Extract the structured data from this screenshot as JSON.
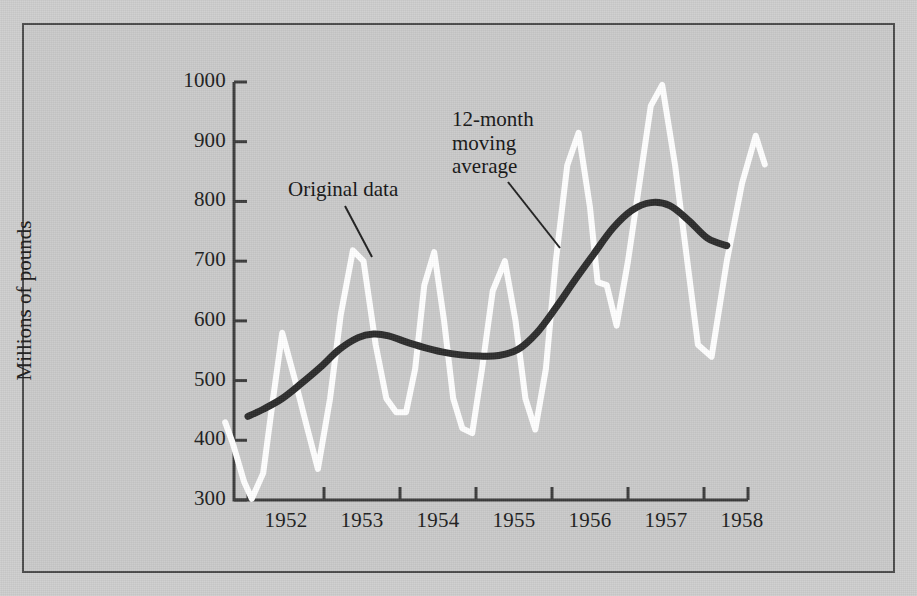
{
  "figure": {
    "background_color": "#c9c9c9",
    "border_color": "#4a4a4a"
  },
  "chart_data": {
    "type": "line",
    "title": "",
    "xlabel": "",
    "ylabel": "Millions of pounds",
    "ylim": [
      300,
      1000
    ],
    "yticks": [
      300,
      400,
      500,
      600,
      700,
      800,
      900,
      1000
    ],
    "ytick_labels": [
      "300",
      "400",
      "500",
      "600",
      "700",
      "800",
      "900",
      "1000"
    ],
    "xlim": [
      1951.67,
      1958.83
    ],
    "xticks": [
      1952,
      1953,
      1954,
      1955,
      1956,
      1957,
      1958
    ],
    "xtick_labels": [
      "1952",
      "1953",
      "1954",
      "1955",
      "1956",
      "1957",
      "1958"
    ],
    "grid": false,
    "legend": "annotations",
    "series": [
      {
        "name": "Original data",
        "color": "#ffffff",
        "line_width": 6,
        "x": [
          1951.7,
          1951.8,
          1951.95,
          1952.05,
          1952.2,
          1952.33,
          1952.45,
          1952.62,
          1952.78,
          1952.92,
          1953.08,
          1953.22,
          1953.38,
          1953.52,
          1953.68,
          1953.82,
          1953.95,
          1954.08,
          1954.2,
          1954.32,
          1954.45,
          1954.58,
          1954.7,
          1954.82,
          1954.95,
          1955.08,
          1955.22,
          1955.38,
          1955.52,
          1955.65,
          1955.78,
          1955.92,
          1956.05,
          1956.2,
          1956.35,
          1956.5,
          1956.6,
          1956.72,
          1956.85,
          1957.0,
          1957.15,
          1957.3,
          1957.45,
          1957.62,
          1957.78,
          1957.92,
          1958.1,
          1958.3,
          1958.5,
          1958.68,
          1958.8
        ],
        "y": [
          430,
          395,
          330,
          302,
          345,
          470,
          580,
          500,
          420,
          352,
          470,
          610,
          718,
          700,
          560,
          470,
          447,
          447,
          520,
          660,
          715,
          600,
          470,
          420,
          412,
          520,
          650,
          700,
          600,
          470,
          418,
          520,
          700,
          860,
          915,
          790,
          665,
          660,
          592,
          700,
          830,
          960,
          995,
          860,
          700,
          560,
          540,
          700,
          830,
          910,
          862
        ]
      },
      {
        "name": "12-month moving average",
        "color": "#2b2b2b",
        "line_width": 7,
        "x": [
          1952.0,
          1952.2,
          1952.45,
          1952.7,
          1952.95,
          1953.2,
          1953.45,
          1953.65,
          1953.85,
          1954.05,
          1954.3,
          1954.55,
          1954.8,
          1955.05,
          1955.3,
          1955.55,
          1955.8,
          1956.05,
          1956.3,
          1956.55,
          1956.8,
          1957.05,
          1957.3,
          1957.55,
          1957.8,
          1958.05,
          1958.3
        ],
        "y": [
          440,
          452,
          470,
          495,
          522,
          552,
          572,
          578,
          575,
          566,
          556,
          548,
          543,
          541,
          542,
          552,
          580,
          622,
          668,
          712,
          755,
          785,
          798,
          793,
          768,
          738,
          726
        ]
      }
    ],
    "annotations": [
      {
        "name": "original-data",
        "text": "Original data",
        "text_x": 288,
        "text_y": 178,
        "leader": {
          "x1": 345,
          "y1": 206,
          "x2": 372,
          "y2": 257
        }
      },
      {
        "name": "moving-average",
        "text": "12-month\nmoving\naverage",
        "text_x": 452,
        "text_y": 108,
        "leader": {
          "x1": 508,
          "y1": 182,
          "x2": 560,
          "y2": 248
        }
      }
    ]
  }
}
